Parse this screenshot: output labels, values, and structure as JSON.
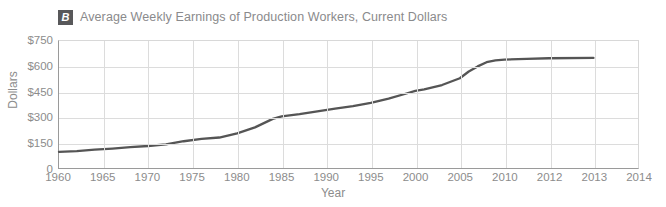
{
  "figure": {
    "badge_label": "B",
    "title": "Average Weekly Earnings of Production Workers, Current Dollars",
    "title_color": "#8a8a8c",
    "badge_bg": "#58585a",
    "line_color": "#555555",
    "grid_color": "#dcdcdc",
    "axis_color": "#9a9a9a"
  },
  "axes": {
    "y_title": "Dollars",
    "x_title": "Year",
    "y_ticks": [
      "0",
      "$150",
      "$300",
      "$450",
      "$600",
      "$750"
    ],
    "x_ticks": [
      "1960",
      "1965",
      "1970",
      "1975",
      "1980",
      "1985",
      "1990",
      "1995",
      "2000",
      "2005",
      "2010",
      "2012",
      "2013",
      "2014"
    ]
  },
  "chart_data": {
    "type": "line",
    "title": "Average Weekly Earnings of Production Workers, Current Dollars",
    "xlabel": "Year",
    "ylabel": "Dollars",
    "ylim": [
      0,
      750
    ],
    "xlim": [
      1960,
      2014
    ],
    "grid": true,
    "legend": false,
    "ytick_values": [
      0,
      150,
      300,
      450,
      600,
      750
    ],
    "ytick_labels": [
      "0",
      "$150",
      "$300",
      "$450",
      "$600",
      "$750"
    ],
    "xtick_labels": [
      "1960",
      "1965",
      "1970",
      "1975",
      "1980",
      "1985",
      "1990",
      "1995",
      "2000",
      "2005",
      "2010",
      "2012",
      "2013",
      "2014"
    ],
    "xtick_positions": [
      1960,
      1965,
      1970,
      1975,
      1980,
      1985,
      1990,
      1995,
      2000,
      2005,
      2010,
      2012,
      2013,
      2014
    ],
    "series": [
      {
        "name": "Average Weekly Earnings (Current Dollars)",
        "x": [
          1960,
          1962,
          1964,
          1966,
          1968,
          1970,
          1972,
          1974,
          1976,
          1978,
          1980,
          1982,
          1984,
          1985,
          1987,
          1989,
          1991,
          1993,
          1995,
          1997,
          1999,
          2000,
          2001,
          2003,
          2005,
          2006,
          2007,
          2008,
          2009,
          2010,
          2011,
          2012,
          2013
        ],
        "values": [
          95,
          100,
          108,
          115,
          123,
          130,
          140,
          158,
          172,
          180,
          205,
          240,
          290,
          305,
          318,
          335,
          350,
          365,
          385,
          410,
          440,
          455,
          465,
          490,
          530,
          570,
          600,
          625,
          635,
          640,
          645,
          648,
          650
        ]
      }
    ]
  }
}
